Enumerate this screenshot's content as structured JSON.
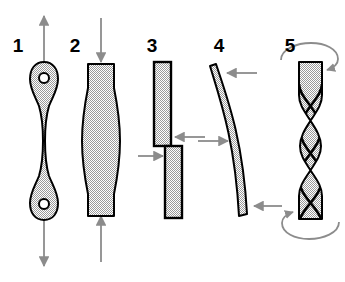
{
  "diagram": {
    "background_color": "#ffffff",
    "outline_color": "#000000",
    "fill_color": "#b4b4b4",
    "arrow_color": "#8c8c8c",
    "label_color": "#000000",
    "width": 345,
    "height": 282
  },
  "figures": [
    {
      "number": "1",
      "label_x": 18,
      "label_y": 52,
      "name": "tension-specimen",
      "loading_mode": "tension",
      "description": "Dogbone tensile specimen with pin holes at both ends, pulled apart by opposing axial arrows",
      "arrows": "two axial arrows pointing away from specimen (up and down)"
    },
    {
      "number": "2",
      "label_x": 75,
      "label_y": 52,
      "name": "compression-specimen",
      "loading_mode": "compression",
      "description": "Barrelled cylindrical specimen bulging at mid-height, squeezed by opposing axial arrows",
      "arrows": "two axial arrows pointing toward specimen (down and up)"
    },
    {
      "number": "3",
      "label_x": 152,
      "label_y": 52,
      "name": "shear-specimen",
      "loading_mode": "shear",
      "description": "Two offset rectangular blocks sliding past one another along a shear plane",
      "arrows": "two opposing horizontal arrows offset vertically"
    },
    {
      "number": "4",
      "label_x": 219,
      "label_y": 52,
      "name": "bending-specimen",
      "loading_mode": "bending",
      "description": "Slender bar bowed into an arc by three-point bending",
      "arrows": "three horizontal arrows, two at the ends and one opposing at mid-span"
    },
    {
      "number": "5",
      "label_x": 290,
      "label_y": 52,
      "name": "torsion-specimen",
      "loading_mode": "torsion",
      "description": "Prismatic bar twisted about its long axis, helical edges visible",
      "arrows": "two curved rotation arrows at top and bottom ends"
    }
  ]
}
